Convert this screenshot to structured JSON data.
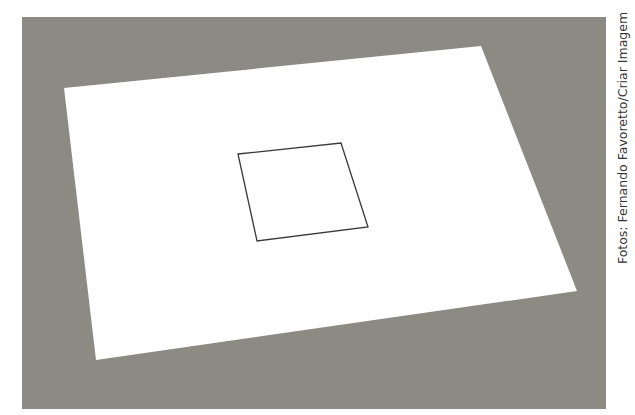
{
  "photo": {
    "background_color": "#8b8a83",
    "description": "Sheet of white paper lying on a gray surface, with a square outline drawn in the center",
    "paper": {
      "color": "#ffffff",
      "corners": [
        [
          64,
          88
        ],
        [
          481,
          46
        ],
        [
          577,
          291
        ],
        [
          96,
          360
        ]
      ]
    },
    "drawn_square": {
      "stroke_color": "#333333",
      "corners": [
        [
          238,
          154
        ],
        [
          341,
          143
        ],
        [
          368,
          227
        ],
        [
          257,
          241
        ]
      ]
    }
  },
  "credit": {
    "text": "Fotos: Fernando Favoretto/Criar Imagem"
  }
}
